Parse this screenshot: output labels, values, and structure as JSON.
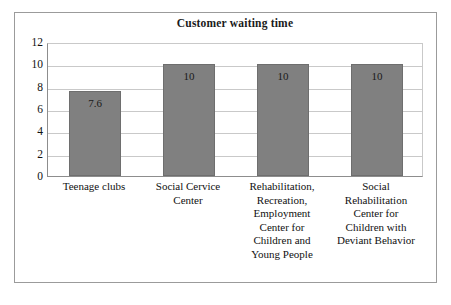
{
  "chart_data": {
    "type": "bar",
    "title": "Customer waiting time",
    "xlabel": "",
    "ylabel": "",
    "ylim": [
      0,
      12
    ],
    "yticks": [
      0,
      2,
      4,
      6,
      8,
      10,
      12
    ],
    "grid": true,
    "legend": "none",
    "categories": [
      "Teenage clubs",
      "Social Cervice Center",
      "Rehabilitation, Recreation, Employment Center for Children and Young People",
      "Social Rehabilitation Center for Children with Deviant Behavior"
    ],
    "category_lines": [
      [
        "Teenage clubs"
      ],
      [
        "Social Cervice",
        "Center"
      ],
      [
        "Rehabilitation,",
        "Recreation,",
        "Employment",
        "Center for",
        "Children and",
        "Young People"
      ],
      [
        "Social",
        "Rehabilitation",
        "Center for",
        "Children with",
        "Deviant Behavior"
      ]
    ],
    "values": [
      7.6,
      10,
      10,
      10
    ],
    "value_labels": [
      "7.6",
      "10",
      "10",
      "10"
    ],
    "bar_color": "#808080",
    "bar_border_color": "#6e6e6e",
    "gridline_color": "#c9c9c9",
    "axis_color": "#8d8d8d",
    "frame_color": "#9b9b9b",
    "text_color": "#111111"
  },
  "ytick_labels": [
    "12",
    "10",
    "8",
    "6",
    "4",
    "2",
    "0"
  ]
}
